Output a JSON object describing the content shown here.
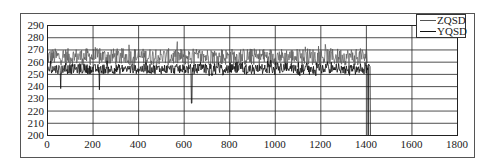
{
  "chart_data": {
    "type": "line",
    "title": "",
    "xlabel": "",
    "ylabel": "",
    "xlim": [
      0,
      1800
    ],
    "ylim": [
      200,
      290
    ],
    "x_ticks": [
      0,
      200,
      400,
      600,
      800,
      1000,
      1200,
      1400,
      1600,
      1800
    ],
    "y_ticks": [
      200,
      210,
      220,
      230,
      240,
      250,
      260,
      270,
      280,
      290
    ],
    "grid": true,
    "legend_position": "top-right",
    "series": [
      {
        "name": "ZQSD",
        "color": "#555555",
        "x_range": [
          0,
          1420
        ],
        "mean": 264,
        "noise_amplitude": 7,
        "approx_range": [
          252,
          276
        ],
        "description": "Upper noisy trace, oscillating around ~262-266"
      },
      {
        "name": "YQSD",
        "color": "#111111",
        "x_range": [
          0,
          1420
        ],
        "mean": 254,
        "noise_amplitude": 4,
        "approx_range": [
          238,
          262
        ],
        "spikes": [
          {
            "x": 60,
            "y": 238
          },
          {
            "x": 230,
            "y": 237
          },
          {
            "x": 635,
            "y": 226
          },
          {
            "x": 1410,
            "y": 200
          },
          {
            "x": 1420,
            "y": 200
          }
        ],
        "description": "Lower noisy trace around ~252-256 with occasional downward spikes; ends with drops to 200 near x≈1410-1420"
      }
    ]
  },
  "legend": {
    "items": [
      {
        "label": "ZQSD"
      },
      {
        "label": "YQSD"
      }
    ]
  }
}
